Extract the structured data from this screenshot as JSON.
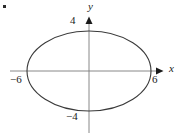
{
  "figure": {
    "background_color": "#ffffff",
    "corner_mark": {
      "name": "corner-dot",
      "color": "#2b2b2b"
    }
  },
  "axes": {
    "x_axis_label": "x",
    "y_axis_label": "y",
    "axis_color": "#7a7a7a",
    "arrow_color": "#1a1a1a",
    "x_axis": {
      "pixel_y": 71,
      "pixel_start_x": 10,
      "pixel_end_x": 162
    },
    "y_axis": {
      "pixel_x": 89,
      "pixel_start_y": 18,
      "pixel_end_y": 133
    }
  },
  "tick_labels": {
    "y_top": "4",
    "y_bottom": "−4",
    "x_left": "−6",
    "x_right": "6"
  },
  "chart_data": {
    "type": "line",
    "title": "",
    "subtitle": "",
    "xlabel": "x",
    "ylabel": "y",
    "grid": false,
    "legend": "none",
    "curve": "ellipse",
    "equation": "x^2/36 + y^2/16 = 1",
    "center": [
      0,
      0
    ],
    "semi_axis_x": 6,
    "semi_axis_y": 4,
    "x_intercepts": [
      -6,
      6
    ],
    "y_intercepts": [
      -4,
      4
    ],
    "xlim": [
      -7.6,
      7.2
    ],
    "ylim": [
      -6.2,
      5.3
    ],
    "xtick_labels": [
      "−6",
      "6"
    ],
    "xtick_values": [
      -6,
      6
    ],
    "ytick_labels": [
      "−4",
      "4"
    ],
    "ytick_values": [
      -4,
      4
    ],
    "curve_color": "#3a3a3a",
    "curve_width": 1.1,
    "pixel_geometry": {
      "center": [
        89,
        71
      ],
      "radius_x": 62,
      "radius_y": 40
    }
  }
}
